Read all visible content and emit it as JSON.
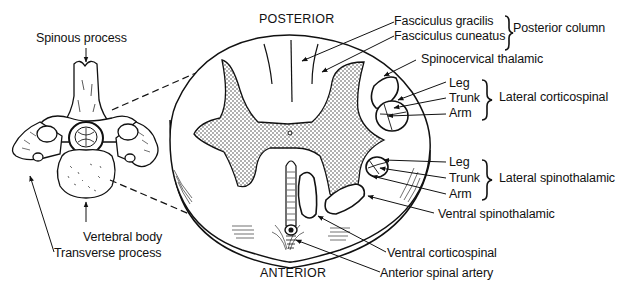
{
  "figure": {
    "orientation": {
      "top": "POSTERIOR",
      "bottom": "ANTERIOR"
    },
    "vertebra_labels": {
      "spinous_process": "Spinous process",
      "vertebral_body": "Vertebral body",
      "transverse_process": "Transverse process"
    },
    "tract_labels": {
      "fasciculus_gracilis": "Fasciculus gracilis",
      "fasciculus_cuneatus": "Fasciculus cuneatus",
      "posterior_column": "Posterior column",
      "spinocervical_thalamic": "Spinocervical thalamic",
      "lateral_corticospinal": {
        "group": "Lateral corticospinal",
        "parts": [
          "Leg",
          "Trunk",
          "Arm"
        ]
      },
      "lateral_spinothalamic": {
        "group": "Lateral spinothalamic",
        "parts": [
          "Leg",
          "Trunk",
          "Arm"
        ]
      },
      "ventral_spinothalamic": "Ventral spinothalamic",
      "ventral_corticospinal": "Ventral corticospinal",
      "anterior_spinal_artery": "Anterior spinal artery"
    }
  }
}
